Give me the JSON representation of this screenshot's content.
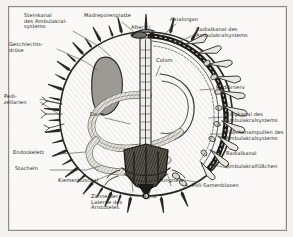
{
  "figure": {
    "title_hidden": "Seeigel Anatomie Querschnitt",
    "border_color": "#8e8b86",
    "paper_color": "#fbfaf8",
    "ink_color": "#25231f",
    "gonad_fill": "#9c9a95",
    "skeleton_fill": "#3a3834"
  },
  "labels": {
    "steinkanal": "Steinkanal\ndes Ambulakral-\nsystems",
    "geschlechtsdruese": "Geschlechts-\ndrüse",
    "pedizellarien": "Pedi-\nzellarien",
    "endoskelett": "Endoskelett",
    "stacheln": "Stacheln",
    "kiemenbueschel": "Kiemenbüschel",
    "zaehne": "Zähne der\nLaterne des\nAristoteles",
    "mund": "Mund",
    "ringnerv": "Ringnerv",
    "poli_samenblasen": "Poli-Samenblasen",
    "madreporenplatte": "Madreporenplatte",
    "after": "After",
    "axialorgan": "Axialorgan",
    "colom": "Colom",
    "darm": "Darm",
    "radialkanal_amb": "Radialkanal des\nAmbulakralsystems",
    "radiaernerv": "Radiärnerv",
    "ringkanal_amb": "Ringkanal des\nAmbulakralsystems",
    "fuesschenampullen": "Füßchenampullen des\nAmbulakralsystems",
    "radialkanal": "Radialkanal",
    "ambulakralfuesschen": "Ambulakralfüßchen"
  },
  "icons": {
    "organism": "sea-urchin-cross-section-diagram"
  }
}
